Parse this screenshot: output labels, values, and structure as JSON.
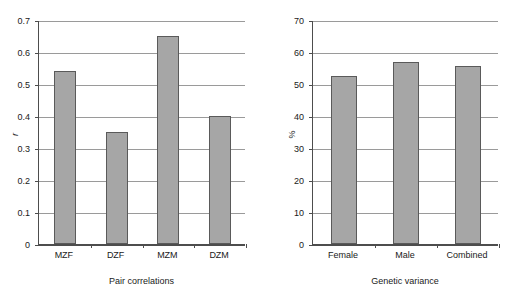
{
  "chart_data": [
    {
      "type": "bar",
      "panel": "left",
      "title": "",
      "xlabel": "Pair correlations",
      "ylabel": "r",
      "ylabel_style": "italic",
      "categories": [
        "MZF",
        "DZF",
        "MZM",
        "DZM"
      ],
      "values": [
        0.54,
        0.35,
        0.65,
        0.4
      ],
      "ylim": [
        0,
        0.7
      ],
      "ytick_step": 0.1,
      "ytick_labels": [
        "0",
        "0.1",
        "0.2",
        "0.3",
        "0.4",
        "0.5",
        "0.6",
        "0.7"
      ],
      "ytick_values": [
        0,
        0.1,
        0.2,
        0.3,
        0.4,
        0.5,
        0.6,
        0.7
      ],
      "grid": true,
      "legend": false,
      "bar_fill": "#a6a6a6",
      "bar_border": "#5a5a5a"
    },
    {
      "type": "bar",
      "panel": "right",
      "title": "",
      "xlabel": "Genetic variance",
      "ylabel": "%",
      "ylabel_style": "normal",
      "categories": [
        "Female",
        "Male",
        "Combined"
      ],
      "values": [
        52.5,
        57.0,
        55.5
      ],
      "ylim": [
        0,
        70
      ],
      "ytick_step": 10,
      "ytick_labels": [
        "0",
        "10",
        "20",
        "30",
        "40",
        "50",
        "60",
        "70"
      ],
      "ytick_values": [
        0,
        10,
        20,
        30,
        40,
        50,
        60,
        70
      ],
      "grid": true,
      "legend": false,
      "bar_fill": "#a6a6a6",
      "bar_border": "#5a5a5a"
    }
  ]
}
